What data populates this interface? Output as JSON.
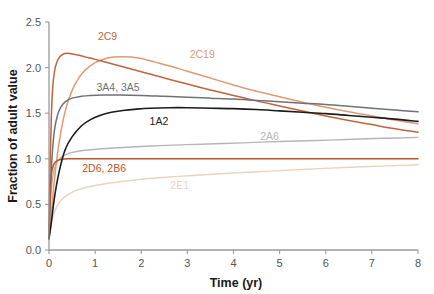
{
  "chart_data": {
    "type": "line",
    "title": "",
    "xlabel": "Time (yr)",
    "ylabel": "Fraction of adult value",
    "xlim": [
      0,
      8
    ],
    "ylim": [
      0,
      2.5
    ],
    "xticks": [
      0,
      1,
      2,
      3,
      4,
      5,
      6,
      7,
      8
    ],
    "xtick_labels": [
      "0",
      "1",
      "2",
      "3",
      "4",
      "5",
      "6",
      "7",
      "8"
    ],
    "yticks": [
      0.0,
      0.5,
      1.0,
      1.5,
      2.0,
      2.5
    ],
    "ytick_labels": [
      "0.0",
      "0.5",
      "1.0",
      "1.5",
      "2.0",
      "2.5"
    ],
    "grid": false,
    "legend_position": "inline-labels",
    "series": [
      {
        "name": "2C9",
        "label": "2C9",
        "color": "#c0643c",
        "label_color": "#c0643c",
        "label_x": 1.06,
        "label_y": 2.3,
        "width": 1.5,
        "x": [
          0.0,
          0.02,
          0.05,
          0.08,
          0.12,
          0.17,
          0.22,
          0.28,
          0.35,
          0.45,
          0.6,
          0.8,
          1.0,
          1.3,
          1.6,
          2.0,
          2.5,
          3.0,
          3.5,
          4.0,
          4.5,
          5.0,
          5.5,
          6.0,
          6.5,
          7.0,
          7.5,
          8.0
        ],
        "values": [
          0.15,
          0.85,
          1.45,
          1.78,
          1.96,
          2.06,
          2.11,
          2.14,
          2.155,
          2.155,
          2.14,
          2.115,
          2.09,
          2.05,
          2.01,
          1.955,
          1.885,
          1.82,
          1.755,
          1.695,
          1.635,
          1.58,
          1.525,
          1.47,
          1.42,
          1.375,
          1.33,
          1.29
        ]
      },
      {
        "name": "2C19",
        "label": "2C19",
        "color": "#e09a72",
        "label_color": "#e09a72",
        "label_x": 3.05,
        "label_y": 2.11,
        "width": 1.5,
        "x": [
          0.0,
          0.05,
          0.12,
          0.22,
          0.35,
          0.5,
          0.65,
          0.8,
          1.0,
          1.2,
          1.4,
          1.6,
          1.8,
          2.0,
          2.3,
          2.6,
          3.0,
          3.5,
          4.0,
          4.5,
          5.0,
          5.5,
          6.0,
          6.5,
          7.0,
          7.5,
          8.0
        ],
        "values": [
          0.13,
          0.4,
          0.78,
          1.18,
          1.52,
          1.75,
          1.89,
          1.98,
          2.055,
          2.095,
          2.115,
          2.12,
          2.115,
          2.1,
          2.06,
          2.02,
          1.96,
          1.885,
          1.81,
          1.74,
          1.68,
          1.62,
          1.565,
          1.515,
          1.47,
          1.425,
          1.385
        ]
      },
      {
        "name": "3A4, 3A5",
        "label": "3A4, 3A5",
        "color": "#6e7277",
        "label_color": "#6e7277",
        "label_x": 1.03,
        "label_y": 1.745,
        "width": 1.5,
        "x": [
          0.0,
          0.03,
          0.07,
          0.12,
          0.18,
          0.25,
          0.35,
          0.5,
          0.7,
          0.9,
          1.2,
          1.5,
          2.0,
          2.5,
          3.0,
          3.5,
          4.0,
          4.5,
          5.0,
          5.5,
          6.0,
          6.5,
          7.0,
          7.5,
          8.0
        ],
        "values": [
          0.13,
          0.62,
          1.05,
          1.32,
          1.47,
          1.56,
          1.625,
          1.665,
          1.685,
          1.695,
          1.7,
          1.7,
          1.695,
          1.685,
          1.675,
          1.665,
          1.655,
          1.64,
          1.625,
          1.61,
          1.595,
          1.575,
          1.555,
          1.535,
          1.515
        ]
      },
      {
        "name": "1A2",
        "label": "1A2",
        "color": "#1c1c1c",
        "label_color": "#1c1c1c",
        "label_x": 2.18,
        "label_y": 1.375,
        "width": 1.6,
        "x": [
          0.0,
          0.05,
          0.12,
          0.22,
          0.35,
          0.5,
          0.7,
          0.9,
          1.1,
          1.35,
          1.6,
          1.9,
          2.2,
          2.6,
          3.0,
          3.5,
          4.0,
          4.5,
          5.0,
          5.5,
          6.0,
          6.5,
          7.0,
          7.5,
          8.0
        ],
        "values": [
          0.12,
          0.3,
          0.58,
          0.86,
          1.1,
          1.24,
          1.36,
          1.43,
          1.475,
          1.51,
          1.53,
          1.545,
          1.555,
          1.56,
          1.56,
          1.555,
          1.55,
          1.54,
          1.525,
          1.51,
          1.495,
          1.475,
          1.455,
          1.435,
          1.41
        ]
      },
      {
        "name": "2D6, 2B6",
        "label": "2D6, 2B6",
        "color": "#b8542e",
        "label_color": "#b8542e",
        "label_x": 0.72,
        "label_y": 0.855,
        "width": 1.5,
        "x": [
          0.0,
          0.02,
          0.05,
          0.09,
          0.14,
          0.2,
          0.28,
          0.4,
          0.55,
          0.8,
          1.2,
          2.0,
          3.0,
          4.0,
          5.0,
          6.0,
          7.0,
          8.0
        ],
        "values": [
          0.15,
          0.58,
          0.82,
          0.92,
          0.965,
          0.985,
          0.995,
          1.0,
          1.0,
          1.0,
          1.0,
          1.0,
          1.0,
          1.0,
          1.0,
          1.0,
          1.0,
          1.0
        ]
      },
      {
        "name": "2A6",
        "label": "2A6",
        "color": "#b5b6b8",
        "label_color": "#b5b6b8",
        "label_x": 4.58,
        "label_y": 1.205,
        "width": 1.4,
        "x": [
          0.0,
          0.03,
          0.08,
          0.15,
          0.25,
          0.4,
          0.6,
          0.9,
          1.3,
          1.8,
          2.4,
          3.0,
          3.6,
          4.2,
          5.0,
          5.8,
          6.6,
          7.3,
          8.0
        ],
        "values": [
          0.13,
          0.5,
          0.8,
          0.94,
          1.01,
          1.055,
          1.08,
          1.1,
          1.115,
          1.13,
          1.145,
          1.155,
          1.165,
          1.175,
          1.19,
          1.2,
          1.215,
          1.225,
          1.235
        ]
      },
      {
        "name": "2E1",
        "label": "2E1",
        "color": "#edd2bd",
        "label_color": "#edd2bd",
        "label_x": 2.63,
        "label_y": 0.665,
        "width": 1.4,
        "x": [
          0.0,
          0.05,
          0.12,
          0.22,
          0.35,
          0.55,
          0.8,
          1.1,
          1.5,
          2.0,
          2.6,
          3.2,
          4.0,
          4.8,
          5.6,
          6.4,
          7.2,
          8.0
        ],
        "values": [
          0.12,
          0.28,
          0.42,
          0.52,
          0.585,
          0.645,
          0.685,
          0.715,
          0.745,
          0.775,
          0.8,
          0.82,
          0.845,
          0.865,
          0.885,
          0.905,
          0.92,
          0.935
        ]
      }
    ]
  }
}
